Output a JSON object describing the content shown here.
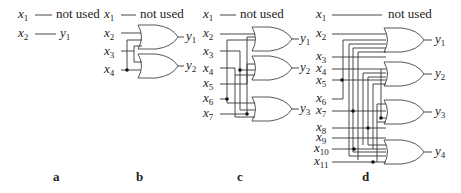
{
  "panels": [
    {
      "caption": "a",
      "inputs": [
        "x1",
        "x2"
      ],
      "not_used_label": "not used",
      "outputs": [
        "y1"
      ],
      "connections": [
        {
          "from": "x2",
          "to": "y1"
        }
      ]
    },
    {
      "caption": "b",
      "inputs": [
        "x1",
        "x2",
        "x3",
        "x4"
      ],
      "not_used_label": "not used",
      "outputs": [
        "y1",
        "y2"
      ],
      "gates": [
        {
          "type": "OR",
          "output": "y1",
          "inputs": [
            "x2",
            "x3",
            "x4"
          ]
        },
        {
          "type": "OR",
          "output": "y2",
          "inputs": [
            "x3",
            "x4"
          ]
        }
      ]
    },
    {
      "caption": "c",
      "inputs": [
        "x1",
        "x2",
        "x3",
        "x4",
        "x5",
        "x6",
        "x7"
      ],
      "not_used_label": "not used",
      "outputs": [
        "y1",
        "y2",
        "y3"
      ],
      "gates": [
        {
          "type": "OR",
          "output": "y1",
          "inputs": [
            "x2",
            "x3",
            "x5"
          ]
        },
        {
          "type": "OR",
          "output": "y2",
          "inputs": [
            "x4",
            "x6",
            "x7"
          ]
        },
        {
          "type": "OR",
          "output": "y3",
          "inputs": [
            "x6",
            "x7",
            "x4"
          ]
        }
      ]
    },
    {
      "caption": "d",
      "inputs": [
        "x1",
        "x2",
        "x3",
        "x4",
        "x5",
        "x6",
        "x7",
        "x8",
        "x9",
        "x10",
        "x11"
      ],
      "not_used_label": "not used",
      "outputs": [
        "y1",
        "y2",
        "y3",
        "y4"
      ],
      "gates": [
        {
          "type": "OR",
          "output": "y1"
        },
        {
          "type": "OR",
          "output": "y2"
        },
        {
          "type": "OR",
          "output": "y3"
        },
        {
          "type": "OR",
          "output": "y4"
        }
      ]
    }
  ],
  "labels": {
    "a_cap": "a",
    "b_cap": "b",
    "c_cap": "c",
    "d_cap": "d",
    "not_used": "not used"
  }
}
